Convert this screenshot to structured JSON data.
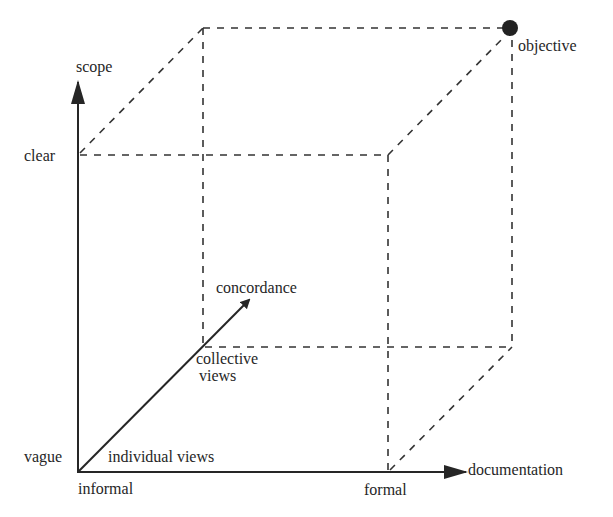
{
  "diagram": {
    "type": "3d-cube-axes",
    "axes": {
      "vertical": {
        "name": "scope",
        "low": "vague",
        "high": "clear"
      },
      "horizontal": {
        "name": "documentation",
        "low": "informal",
        "high": "formal"
      },
      "depth": {
        "name": "concordance",
        "low": "individual views",
        "high": "collective views"
      }
    },
    "labels": {
      "scope": "scope",
      "clear": "clear",
      "vague": "vague",
      "documentation": "documentation",
      "informal": "informal",
      "formal": "formal",
      "concordance": "concordance",
      "individual_views": "individual views",
      "collective_views_line1": "collective",
      "collective_views_line2": "views",
      "objective": "objective"
    },
    "marker": {
      "label": "objective",
      "position": "clear / formal / collective views corner",
      "color": "#222222"
    },
    "colors": {
      "line": "#262626",
      "background": "#ffffff"
    }
  }
}
